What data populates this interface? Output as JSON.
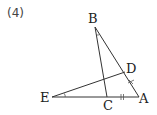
{
  "problem_number": "(4)",
  "points": {
    "A": {
      "label": "A"
    },
    "B": {
      "label": "B"
    },
    "C": {
      "label": "C"
    },
    "D": {
      "label": "D"
    },
    "E": {
      "label": "E"
    }
  },
  "segments": [
    "AB",
    "BC",
    "EA",
    "ED"
  ],
  "marks": {
    "CA": "double-tick",
    "DA": "cross-tick",
    "angle_B": "arc",
    "angle_E": "arc"
  }
}
